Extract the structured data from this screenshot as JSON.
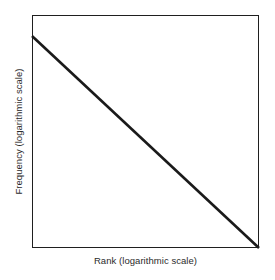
{
  "figure": {
    "background_color": "#ffffff",
    "axes": {
      "x_label": "Rank (logarithmic scale)",
      "y_label": "Frequency (logarithmic scale)"
    }
  },
  "chart_data": {
    "type": "line",
    "title": "",
    "subtitle": "",
    "xlabel": "Rank (logarithmic scale)",
    "ylabel": "Frequency (logarithmic scale)",
    "x_scale": "log",
    "y_scale": "log",
    "grid": false,
    "legend": null,
    "legend_position": "none",
    "xlim": [
      0,
      1
    ],
    "ylim": [
      0,
      1
    ],
    "x_ticks": [],
    "y_ticks": [],
    "x_tick_labels": [],
    "y_tick_labels": [],
    "annotations": [],
    "series": [
      {
        "name": "Zipf power law",
        "color": "#1a1a1a",
        "line_width": 2.6,
        "description": "Straight descending line on log-log axes (power law)",
        "x": [
          0.0,
          0.25,
          0.5,
          0.75,
          1.0
        ],
        "values": [
          0.91,
          0.6825,
          0.455,
          0.2275,
          0.0
        ]
      }
    ]
  }
}
